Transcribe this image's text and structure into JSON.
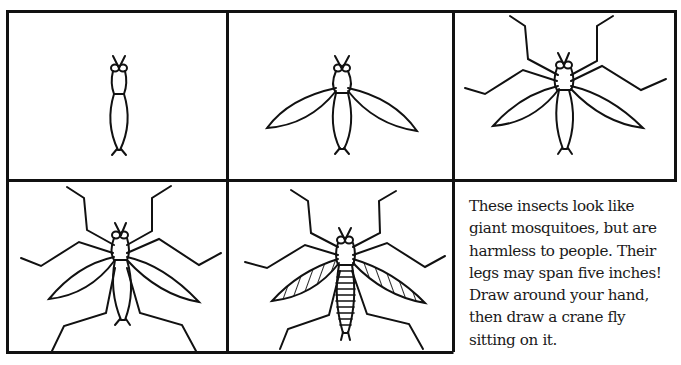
{
  "page": {
    "subject": "crane fly"
  },
  "panels": [
    {
      "step": 1,
      "description": "Thin elongated body with head, eyes and antennae"
    },
    {
      "step": 2,
      "description": "Add two long narrow wings"
    },
    {
      "step": 3,
      "description": "Add four long jointed front legs"
    },
    {
      "step": 4,
      "description": "Add two jointed back legs"
    },
    {
      "step": 5,
      "description": "Finish with hatched wings and segmented abdomen"
    }
  ],
  "caption": {
    "lines": [
      "These insects look like",
      "giant mosquitoes, but are",
      "harmless to people. Their",
      "legs may span five inches!",
      "Draw around your hand,",
      "then draw a crane fly",
      "sitting on it."
    ]
  },
  "colors": {
    "ink": "#111111",
    "paper": "#ffffff"
  }
}
